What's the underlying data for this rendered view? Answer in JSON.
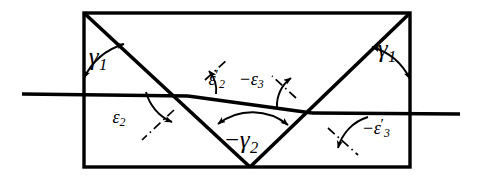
{
  "figure": {
    "type": "optical-ray-path-diagram",
    "background_color": "#ffffff",
    "line_color": "#000000",
    "width": 478,
    "height": 180
  },
  "labels": {
    "gamma1_left": {
      "minus": "",
      "symbol": "γ",
      "prime": "",
      "sub": "1"
    },
    "gamma1_right": {
      "minus": "",
      "symbol": "γ",
      "prime": "",
      "sub": "1"
    },
    "epsilon2": {
      "minus": "",
      "symbol": "ε",
      "prime": "",
      "sub": "2"
    },
    "epsilon2_prime": {
      "minus": "",
      "symbol": "ε",
      "prime": "′",
      "sub": "2"
    },
    "epsilon3_neg": {
      "minus": "−",
      "symbol": "ε",
      "prime": "",
      "sub": "3"
    },
    "gamma2_neg": {
      "minus": "−",
      "symbol": "γ",
      "prime": "",
      "sub": "2"
    },
    "epsilon3_prime_neg": {
      "minus": "−",
      "symbol": "ε",
      "prime": "′",
      "sub": "3"
    }
  },
  "geometry": {
    "plate": {
      "x1": 84,
      "y1": 13,
      "x2": 410,
      "y2": 167
    },
    "incident_ray": {
      "x1": 22,
      "y1": 94,
      "x2": 188,
      "y2": 96
    },
    "internal_ray": {
      "x1": 188,
      "y1": 96,
      "x2": 312,
      "y2": 113
    },
    "exit_ray": {
      "x1": 312,
      "y1": 113,
      "x2": 460,
      "y2": 114
    },
    "diagonal_left": {
      "x1": 84,
      "y1": 13,
      "x2": 250,
      "y2": 167
    },
    "diagonal_right": {
      "x1": 250,
      "y1": 167,
      "x2": 410,
      "y2": 13
    },
    "vertex_first": {
      "x": 188,
      "y": 96
    },
    "vertex_second": {
      "x": 312,
      "y": 113
    },
    "vertex_bottom": {
      "x": 250,
      "y": 167
    }
  }
}
